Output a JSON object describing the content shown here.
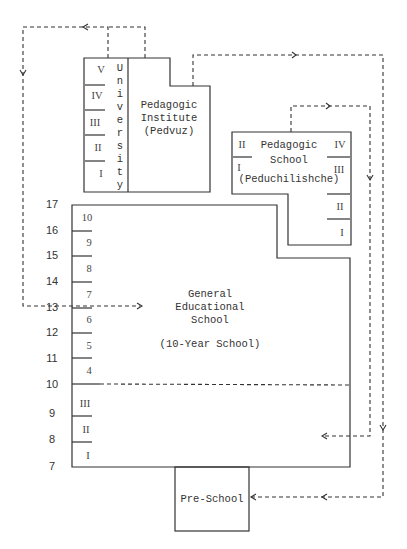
{
  "diagram": {
    "type": "education-system-structure",
    "age_axis": [
      "17",
      "16",
      "15",
      "14",
      "13",
      "12",
      "11",
      "10",
      "9",
      "8",
      "7"
    ],
    "university": {
      "label_letters": [
        "U",
        "n",
        "i",
        "v",
        "e",
        "r",
        "s",
        "i",
        "t",
        "y"
      ],
      "years": [
        "V",
        "IV",
        "III",
        "II",
        "I"
      ]
    },
    "pedagogic_institute": {
      "line1": "Pedagogic",
      "line2": "Institute",
      "line3": "(Pedvuz)"
    },
    "pedagogic_school": {
      "line1": "Pedagogic",
      "line2": "School",
      "line3": "(Peduchilishche)",
      "years_left": [
        "II",
        "I"
      ],
      "years_right": [
        "IV",
        "III",
        "II",
        "I"
      ]
    },
    "general_school": {
      "line1": "General",
      "line2": "Educational",
      "line3": "School",
      "line4": "(10-Year School)",
      "upper_grades": [
        "10",
        "9",
        "8",
        "7",
        "6",
        "5",
        "4"
      ],
      "primary_grades": [
        "III",
        "II",
        "I"
      ]
    },
    "preschool": {
      "label": "Pre-School"
    }
  }
}
